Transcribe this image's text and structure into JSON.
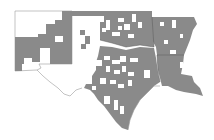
{
  "map": {
    "type": "choropleth",
    "region": "South Central United States",
    "states": [
      "New Mexico",
      "Texas",
      "Oklahoma",
      "Arkansas",
      "Louisiana"
    ],
    "colors": {
      "background": "#ffffff",
      "shaded": "#8a8a8a",
      "border": "#5a5a5a",
      "outline": "#9a9a9a"
    },
    "legend": null,
    "title": null
  }
}
